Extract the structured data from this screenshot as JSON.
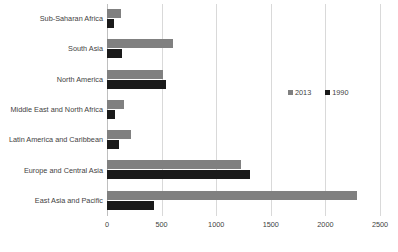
{
  "chart_data": {
    "type": "bar",
    "orientation": "horizontal",
    "title": "",
    "xlabel": "",
    "ylabel": "",
    "xlim": [
      0,
      2500
    ],
    "grid": true,
    "legend_position": "middle-right",
    "categories": [
      "Sub-Saharan Africa",
      "South Asia",
      "North America",
      "Middle East and North Africa",
      "Latin America and Caribbean",
      "Europe and Central Asia",
      "East Asia and Pacific"
    ],
    "xticks": [
      "0",
      "500",
      "1000",
      "1500",
      "2000",
      "2500"
    ],
    "xtick_values": [
      0,
      500,
      1000,
      1500,
      2000,
      2500
    ],
    "series": [
      {
        "name": "2013",
        "color": "#808080",
        "values": [
          130,
          600,
          510,
          160,
          220,
          1230,
          2290
        ]
      },
      {
        "name": "1990",
        "color": "#1a1a1a",
        "values": [
          60,
          140,
          540,
          70,
          110,
          1310,
          430
        ]
      }
    ]
  },
  "legend": {
    "items": [
      {
        "label": "2013",
        "swatch": "legend-swatch-2013"
      },
      {
        "label": "1990",
        "swatch": "legend-swatch-1990"
      }
    ]
  },
  "colors": {
    "series_2013": "#808080",
    "series_1990": "#1a1a1a",
    "gridline": "#d9d9d9",
    "axis": "#bfbfbf",
    "text": "#3f3f3f",
    "background": "#ffffff"
  }
}
